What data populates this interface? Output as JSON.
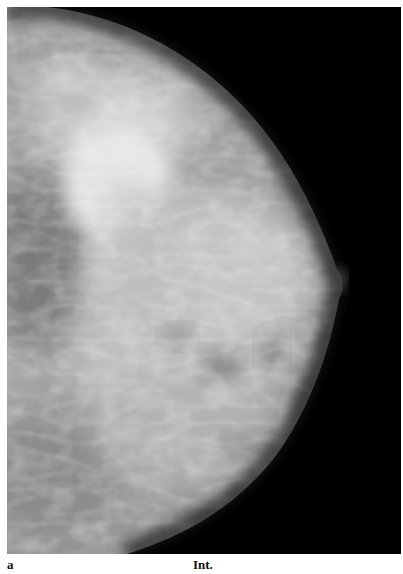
{
  "figure": {
    "panel_label": "a",
    "view_label": "Int.",
    "image_description": "mammogram",
    "colors": {
      "background": "#000000",
      "tissue_light": "#e6e6e6",
      "tissue_mid": "#a8a8a8",
      "tissue_dark": "#6e6e6e",
      "page": "#ffffff"
    }
  }
}
